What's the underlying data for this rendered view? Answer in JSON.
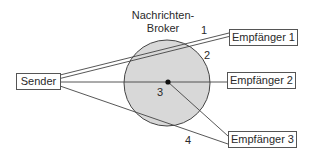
{
  "broker": {
    "title_line1": "Nachrichten-",
    "title_line2": "Broker",
    "fill_color": "#d8d8d8",
    "stroke_color": "#444444"
  },
  "nodes": {
    "sender": "Sender",
    "receiver1": "Empfänger 1",
    "receiver2": "Empfänger 2",
    "receiver3": "Empfänger 3"
  },
  "route_labels": {
    "r1": "1",
    "r2": "2",
    "r3": "3",
    "r4": "4"
  }
}
